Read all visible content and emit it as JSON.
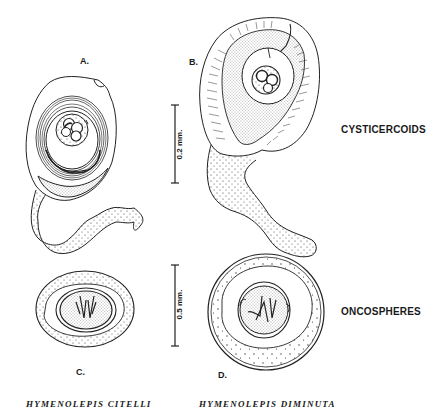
{
  "figure": {
    "panels": [
      {
        "id": "A",
        "label": "A.",
        "subject": "cysticercoid",
        "species": "Hymenolepis citelli"
      },
      {
        "id": "B",
        "label": "B.",
        "subject": "cysticercoid",
        "species": "Hymenolepis diminuta"
      },
      {
        "id": "C",
        "label": "C.",
        "subject": "oncosphere",
        "species": "Hymenolepis citelli"
      },
      {
        "id": "D",
        "label": "D.",
        "subject": "oncosphere",
        "species": "Hymenolepis diminuta"
      }
    ],
    "row_labels": {
      "cysticercoids": "CYSTICERCOIDS",
      "oncospheres": "ONCOSPHERES"
    },
    "scale_bars": {
      "top": "0.2 mm.",
      "bottom": "0.5 mm."
    },
    "species_captions": {
      "left": "HYMENOLEPIS CITELLI",
      "right": "HYMENOLEPIS DIMINUTA"
    }
  }
}
